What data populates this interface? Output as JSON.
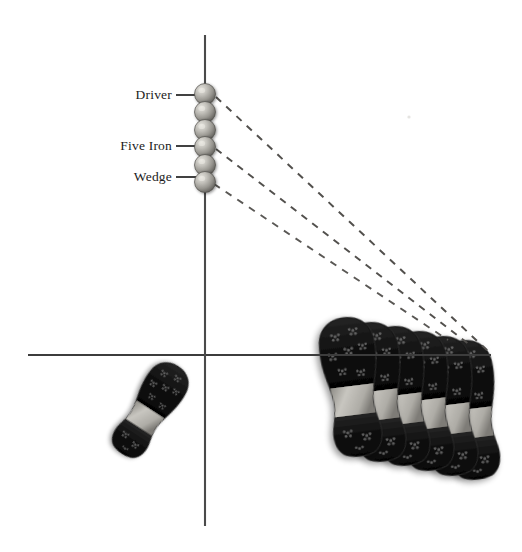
{
  "figure": {
    "background_color": "#ffffff",
    "width": 522,
    "height": 552
  },
  "axes": {
    "vertical": {
      "name": "target-line",
      "x": 205,
      "y_top": 35,
      "y_bottom": 526,
      "color": "#4a4a4a",
      "width": 2.1
    },
    "horizontal": {
      "name": "stance-line",
      "y": 355,
      "x_left": 28,
      "x_right": 491,
      "color": "#3c3c3c",
      "width": 2.1
    }
  },
  "balls": {
    "count": 6,
    "x": 205,
    "radius": 10.5,
    "color_light": "#d8d6d0",
    "color_mid": "#9d9b95",
    "color_dark": "#5e5c58",
    "positions_y": [
      94,
      112,
      130,
      147,
      165,
      182
    ]
  },
  "labels": [
    {
      "id": "driver",
      "text": "Driver",
      "y": 95,
      "text_right_x": 172,
      "leader_x1": 176,
      "leader_x2": 196,
      "ball_index": 0
    },
    {
      "id": "five-iron",
      "text": "Five Iron",
      "y": 146,
      "text_right_x": 172,
      "leader_x1": 176,
      "leader_x2": 196,
      "ball_index": 3
    },
    {
      "id": "wedge",
      "text": "Wedge",
      "y": 177,
      "text_right_x": 172,
      "leader_x1": 176,
      "leader_x2": 196,
      "ball_index": 5
    }
  ],
  "trajectories": [
    {
      "id": "driver-path",
      "x1": 216,
      "y1": 97,
      "x2": 489,
      "y2": 352,
      "dash": "7 7",
      "color": "#52504d",
      "width": 2.0
    },
    {
      "id": "five-iron-path",
      "x1": 216,
      "y1": 149,
      "x2": 470,
      "y2": 345,
      "dash": "7 6.5",
      "color": "#52504d",
      "width": 2.0
    },
    {
      "id": "wedge-path",
      "x1": 214,
      "y1": 184,
      "x2": 448,
      "y2": 340,
      "dash": "7 7",
      "color": "#5a5855",
      "width": 1.9
    }
  ],
  "footprints": {
    "front_foot": {
      "name": "front-foot-print",
      "cx": 150,
      "cy": 410,
      "rotation_deg": 33,
      "length": 104,
      "width": 44
    },
    "back_foot_cluster": {
      "name": "back-foot-print-cluster",
      "count": 6,
      "rotation_deg": -7,
      "length": 140,
      "width": 58,
      "origins": [
        {
          "cx": 352,
          "cy": 387
        },
        {
          "cx": 376,
          "cy": 392
        },
        {
          "cx": 400,
          "cy": 396
        },
        {
          "cx": 424,
          "cy": 401
        },
        {
          "cx": 448,
          "cy": 406
        },
        {
          "cx": 470,
          "cy": 410
        }
      ]
    },
    "colors": {
      "sole_dark": "#1a1a1a",
      "sole_black": "#0d0d0d",
      "arch_gray": "#a6a49e",
      "arch_light": "#c4c2bc",
      "edge": "#2e2e2e",
      "spike": "#6b6b6b",
      "shadow": "#b8b6b2"
    }
  },
  "speck": {
    "x": 409,
    "y": 117,
    "color": "#cfcdc9"
  }
}
